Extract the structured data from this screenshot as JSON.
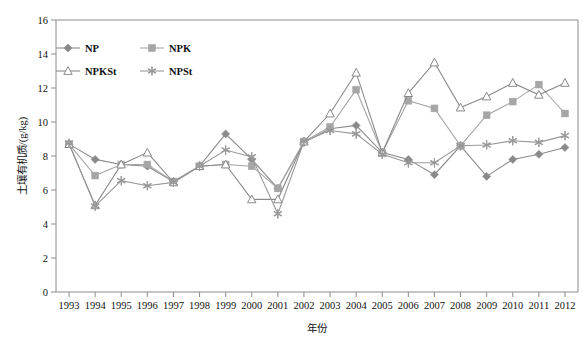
{
  "chart_data": {
    "type": "line",
    "title": "",
    "xlabel": "年份",
    "ylabel": "土壤有机质/(g/kg)",
    "xlim": [
      1993,
      2012
    ],
    "ylim": [
      0,
      16
    ],
    "ytick_step": 2,
    "grid": false,
    "legend_position": "top-left",
    "categories": [
      1993,
      1994,
      1995,
      1996,
      1997,
      1998,
      1999,
      2000,
      2001,
      2002,
      2003,
      2004,
      2005,
      2006,
      2007,
      2008,
      2009,
      2010,
      2011,
      2012
    ],
    "xticklabels": [
      "1993",
      "1994",
      "1995",
      "1996",
      "1997",
      "1998",
      "1999",
      "2000",
      "2001",
      "2002",
      "2003",
      "2004",
      "2005",
      "2006",
      "2007",
      "2008",
      "2009",
      "2010",
      "2011",
      "2012"
    ],
    "yticklabels": [
      "0",
      "2",
      "4",
      "6",
      "8",
      "10",
      "12",
      "14",
      "16"
    ],
    "series": [
      {
        "name": "NP",
        "marker": "filled-diamond",
        "color": "#8a8a8a",
        "values": [
          8.7,
          7.8,
          7.5,
          7.4,
          6.5,
          7.4,
          9.3,
          7.8,
          6.1,
          8.8,
          9.6,
          9.8,
          8.2,
          7.8,
          6.9,
          8.6,
          6.8,
          7.8,
          8.1,
          8.5
        ]
      },
      {
        "name": "NPK",
        "marker": "filled-square",
        "color": "#a6a6a6",
        "values": [
          8.7,
          6.85,
          7.5,
          7.5,
          6.5,
          7.4,
          7.5,
          7.4,
          6.1,
          8.85,
          9.7,
          11.9,
          8.2,
          11.25,
          10.8,
          8.6,
          10.4,
          11.2,
          12.2,
          10.5
        ]
      },
      {
        "name": "NPKSt",
        "marker": "open-triangle",
        "color": "#8a8a8a",
        "values": [
          8.7,
          5.1,
          7.5,
          8.2,
          6.45,
          7.4,
          7.5,
          5.45,
          5.45,
          8.85,
          10.5,
          12.9,
          8.2,
          11.7,
          13.5,
          10.85,
          11.5,
          12.3,
          11.6,
          12.3
        ]
      },
      {
        "name": "NPSt",
        "marker": "asterisk",
        "color": "#999999",
        "values": [
          8.75,
          5.05,
          6.55,
          6.25,
          6.45,
          7.4,
          8.35,
          7.95,
          4.6,
          8.85,
          9.5,
          9.3,
          8.1,
          7.6,
          7.6,
          8.6,
          8.65,
          8.9,
          8.8,
          9.2
        ]
      }
    ]
  },
  "legend": {
    "items": [
      {
        "label": "NP"
      },
      {
        "label": "NPK"
      },
      {
        "label": "NPKSt"
      },
      {
        "label": "NPSt"
      }
    ]
  },
  "colors": {
    "np": "#8a8a8a",
    "npk": "#a6a6a6",
    "npkst": "#8a8a8a",
    "npst": "#999999",
    "axis": "#8c8c8c",
    "text": "#111111"
  }
}
